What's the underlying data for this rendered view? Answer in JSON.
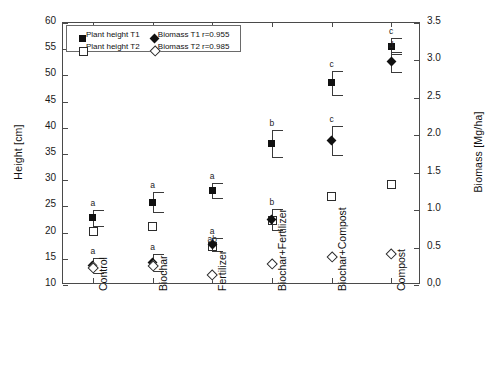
{
  "chart_data": {
    "type": "scatter",
    "title": "",
    "xlabel": "",
    "ylabel": "Height [cm]",
    "ylabel_right": "Biomass [Mg/ha]",
    "ylim": [
      10,
      60
    ],
    "yticks": [
      "10",
      "15",
      "20",
      "25",
      "30",
      "35",
      "40",
      "45",
      "50",
      "55",
      "60"
    ],
    "ylim_right": [
      0.0,
      3.5
    ],
    "yticks_right": [
      "0,0",
      "0.5",
      "1.0",
      "1.5",
      "2.0",
      "2.5",
      "3.0",
      "3.5"
    ],
    "grid": false,
    "legend_position": "top-left",
    "categories": [
      "Control",
      "Biochar",
      "Fertilizer",
      "Biochar+Fertilizer",
      "Biochar+Compost",
      "Compost"
    ],
    "series": [
      {
        "name": "Plant height T1",
        "marker": "filled-square",
        "axis": "left",
        "unit": "cm",
        "values": [
          22.8,
          25.8,
          28.0,
          37.0,
          48.6,
          55.6
        ],
        "errors": [
          1.5,
          1.9,
          1.4,
          2.6,
          2.3,
          1.6
        ],
        "letters": [
          "a",
          "a",
          "a",
          "b",
          "c",
          "c"
        ]
      },
      {
        "name": "Plant height T2",
        "marker": "open-square",
        "axis": "left",
        "unit": "cm",
        "values": [
          20.3,
          21.2,
          17.5,
          22.4,
          26.9,
          29.3
        ],
        "errors": [
          null,
          null,
          null,
          null,
          null,
          null
        ],
        "letters": [
          "",
          "",
          "ab",
          "",
          "",
          ""
        ]
      },
      {
        "name": "Biomass T1",
        "marker": "filled-diamond",
        "axis": "right",
        "unit": "Mg/ha",
        "values": [
          0.26,
          0.3,
          0.54,
          0.87,
          1.93,
          2.98
        ],
        "errors": [
          0.1,
          0.11,
          0.09,
          0.14,
          0.19,
          0.13
        ],
        "letters": [
          "a",
          "a",
          "a",
          "b",
          "c",
          "d"
        ]
      },
      {
        "name": "Biomass T2",
        "marker": "open-diamond",
        "axis": "right",
        "unit": "Mg/ha",
        "values": [
          0.23,
          0.26,
          0.14,
          0.28,
          0.37,
          0.41
        ],
        "errors": [
          null,
          null,
          null,
          null,
          null,
          null
        ],
        "letters": [
          "",
          "",
          "",
          "",
          "",
          ""
        ]
      }
    ],
    "annotations": [
      {
        "text": "r=0.955",
        "for": "Biomass T1"
      },
      {
        "text": "r=0.985",
        "for": "Biomass T2"
      }
    ]
  },
  "legend": {
    "entries": [
      {
        "label": "Plant height T1",
        "marker": "filled-square"
      },
      {
        "label": "Plant height T2",
        "marker": "open-square"
      },
      {
        "label": "Biomass T1",
        "marker": "filled-diamond"
      },
      {
        "label": "Biomass T2",
        "marker": "open-diamond"
      }
    ],
    "r1": "r=0.955",
    "r2": "r=0.985"
  }
}
